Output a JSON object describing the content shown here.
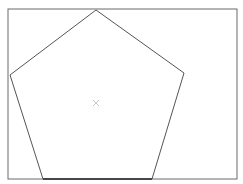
{
  "diagram": {
    "type": "regular-pentagon-in-frame",
    "frame": {
      "x": 8,
      "y": 9,
      "width": 229,
      "height": 170,
      "stroke": "#6a6a6a"
    },
    "pentagon": {
      "points": [
        [
          96,
          10
        ],
        [
          184,
          73
        ],
        [
          152,
          179
        ],
        [
          43,
          179
        ],
        [
          10,
          75
        ]
      ],
      "stroke": "#555555",
      "bottom_edge_stroke": "#333333"
    },
    "center_marker": {
      "x": 96,
      "y": 103,
      "symbol": "×",
      "color": "#c8c8c8"
    }
  }
}
